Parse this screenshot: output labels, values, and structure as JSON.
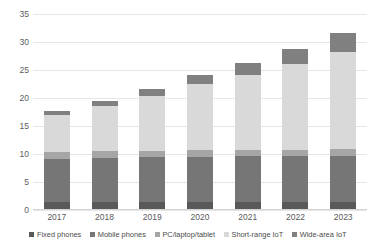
{
  "chart_data": {
    "type": "bar",
    "subtype": "stacked-vertical",
    "title": "",
    "subtitle": "",
    "xlabel": "",
    "ylabel": "",
    "categories": [
      "2017",
      "2018",
      "2019",
      "2020",
      "2021",
      "2022",
      "2023"
    ],
    "ylim": [
      0,
      35
    ],
    "yticks": [
      0,
      5,
      10,
      15,
      20,
      25,
      30,
      35
    ],
    "ytick_labels": [
      "0",
      "5",
      "10",
      "15",
      "20",
      "25",
      "30",
      "35"
    ],
    "grid": true,
    "grid_axis": "y",
    "legend_position": "bottom",
    "series": [
      {
        "name": "Fixed phones",
        "color": "#595959",
        "values": [
          1.5,
          1.5,
          1.5,
          1.5,
          1.5,
          1.4,
          1.4
        ]
      },
      {
        "name": "Mobile phones",
        "color": "#767676",
        "values": [
          7.6,
          7.8,
          7.9,
          8.0,
          8.1,
          8.2,
          8.3
        ]
      },
      {
        "name": "PC/laptop/tablet",
        "color": "#a6a6a6",
        "values": [
          1.2,
          1.2,
          1.2,
          1.2,
          1.2,
          1.2,
          1.2
        ]
      },
      {
        "name": "Short-range IoT",
        "color": "#d9d9d9",
        "values": [
          6.7,
          8.0,
          9.8,
          11.8,
          13.4,
          15.3,
          17.4
        ]
      },
      {
        "name": "Wide-area IoT",
        "color": "#808080",
        "values": [
          0.7,
          0.9,
          1.3,
          1.6,
          2.0,
          2.6,
          3.3
        ]
      }
    ],
    "totals": [
      17.7,
      19.4,
      21.7,
      24.1,
      26.2,
      28.7,
      31.6
    ]
  },
  "legend": {
    "items": [
      {
        "label": "Fixed phones",
        "color": "#595959"
      },
      {
        "label": "Mobile phones",
        "color": "#767676"
      },
      {
        "label": "PC/laptop/tablet",
        "color": "#a6a6a6"
      },
      {
        "label": "Short-range IoT",
        "color": "#d9d9d9"
      },
      {
        "label": "Wide-area IoT",
        "color": "#808080"
      }
    ]
  },
  "colors": {
    "gridline": "#e6e6e6",
    "tick_text": "#5a5a5a",
    "legend_text": "#4a4a4a",
    "background": "#ffffff"
  }
}
